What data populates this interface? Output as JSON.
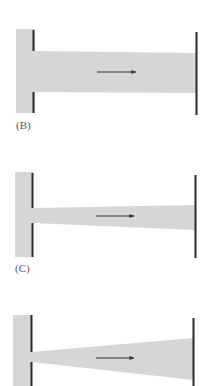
{
  "colors": {
    "fill": "#d6d6d6",
    "plate": "#2a2a2a",
    "arrow": "#333333",
    "label": "#555555"
  },
  "panels": [
    {
      "id": "B",
      "label": "(B)",
      "shape": "straight-channel",
      "description": "Uniform-width channel from left reservoir to right plate",
      "reservoir": {
        "x": 16,
        "y": 29,
        "w": 18,
        "h": 84
      },
      "left_plate": {
        "x": 33,
        "y_top": 30,
        "y_bottom": 113,
        "gap_top": 51,
        "gap_bottom": 92
      },
      "channel": {
        "x1": 34,
        "x2": 196,
        "left_top": 51,
        "left_bottom": 92,
        "right_top": 53,
        "right_bottom": 93
      },
      "right_plate": {
        "x": 196,
        "y_top": 32,
        "y_bottom": 115
      },
      "arrow": {
        "x1": 97,
        "x2": 136,
        "y": 72
      },
      "label_pos": {
        "x": 16,
        "y": 129
      }
    },
    {
      "id": "C",
      "label": "(C)",
      "shape": "slightly-diverging-channel",
      "description": "Narrow opening widening slightly toward right plate",
      "reservoir": {
        "x": 15,
        "y": 172,
        "w": 17,
        "h": 85
      },
      "left_plate": {
        "x": 32,
        "y_top": 173,
        "y_bottom": 257,
        "gap_top": 208,
        "gap_bottom": 223
      },
      "channel": {
        "x1": 33,
        "x2": 195,
        "left_top": 208,
        "left_bottom": 223,
        "right_top": 205,
        "right_bottom": 230
      },
      "right_plate": {
        "x": 195,
        "y_top": 175,
        "y_bottom": 258
      },
      "arrow": {
        "x1": 96,
        "x2": 134,
        "y": 216
      },
      "label_pos": {
        "x": 15,
        "y": 272
      }
    },
    {
      "id": "D",
      "label": "",
      "shape": "strongly-diverging-channel",
      "description": "Very narrow opening widening strongly toward right plate",
      "reservoir": {
        "x": 13,
        "y": 315,
        "w": 18,
        "h": 71
      },
      "left_plate": {
        "x": 31,
        "y_top": 315,
        "y_bottom": 386,
        "gap_top": 352,
        "gap_bottom": 362
      },
      "channel": {
        "x1": 32,
        "x2": 193,
        "left_top": 352,
        "left_bottom": 362,
        "right_top": 338,
        "right_bottom": 380
      },
      "right_plate": {
        "x": 193,
        "y_top": 318,
        "y_bottom": 386
      },
      "arrow": {
        "x1": 96,
        "x2": 134,
        "y": 358
      },
      "label_pos": null
    }
  ]
}
